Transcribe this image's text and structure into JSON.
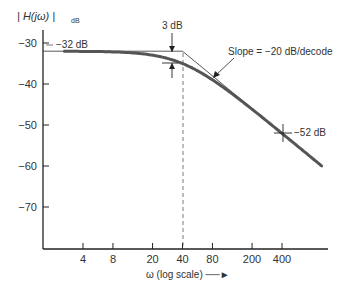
{
  "chart_data": {
    "type": "line",
    "title": "",
    "ylabel": "| H(jω) |",
    "ylabel_sub": "dB",
    "xlabel": "ω (log scale)",
    "xscale": "log",
    "xticks": [
      4,
      8,
      20,
      40,
      80,
      200,
      400
    ],
    "xtick_labels": [
      "4",
      "8",
      "20",
      "40",
      "80",
      "200",
      "400"
    ],
    "yticks": [
      -30,
      -40,
      -50,
      -60,
      -70
    ],
    "ytick_labels": [
      "−30",
      "−40",
      "−50",
      "−60",
      "−70"
    ],
    "xlim": [
      2,
      1000
    ],
    "ylim": [
      -80,
      -28
    ],
    "grid": false,
    "corner_frequency": 40,
    "series": [
      {
        "name": "Actual magnitude response",
        "x": [
          2,
          4,
          8,
          20,
          40,
          80,
          200,
          400,
          1000
        ],
        "values": [
          -32.0,
          -32.0,
          -32.2,
          -33.0,
          -35.0,
          -39.0,
          -46.2,
          -52.0,
          -60.0
        ]
      },
      {
        "name": "Asymptotic (Bode) approximation",
        "x": [
          2,
          40,
          400,
          1000
        ],
        "values": [
          -32,
          -32,
          -52,
          -60
        ]
      }
    ],
    "annotations": [
      {
        "text": "−32 dB",
        "at": {
          "x": 2,
          "y": -32
        }
      },
      {
        "text": "3 dB",
        "at": {
          "x": 40,
          "y": -32
        },
        "note": "gap between asymptote and curve at corner frequency"
      },
      {
        "text": "Slope = −20 dB/decode",
        "at": {
          "x": 100,
          "y": -40
        }
      },
      {
        "text": "−52 dB",
        "at": {
          "x": 400,
          "y": -52
        }
      }
    ]
  },
  "labels": {
    "y_axis_title": "| H(jω) |",
    "y_axis_sub": "dB",
    "x_axis_title": "ω (log scale) ──►",
    "flat_label": "−32 dB",
    "gap_label": "3 dB",
    "slope_label": "Slope = −20 dB/decode",
    "point_label": "−52 dB"
  },
  "colors": {
    "curve": "#555555",
    "asymptote": "#444444",
    "axis": "#222222",
    "text": "#333333"
  }
}
